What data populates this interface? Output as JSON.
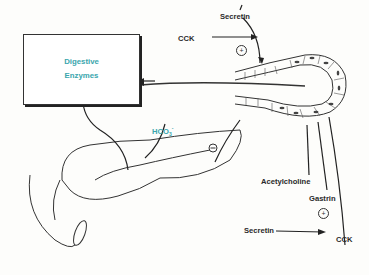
{
  "diagram": {
    "box": {
      "line1": "Digestive",
      "line2": "Enzymes",
      "color": "#3aa6ad"
    },
    "bicarbonate": {
      "base": "HCO",
      "sub": "3",
      "sup": "-",
      "color": "#3aa6ad"
    },
    "acinus_stimuli": {
      "secretin": "Secretin",
      "cck": "CCK",
      "plus": "+"
    },
    "duct_stimuli": {
      "acetylcholine": "Acetylcholine",
      "gastrin": "Gastrin",
      "secretin": "Secretin",
      "cck": "CCK",
      "plus": "+"
    },
    "inhibition_symbol": "−",
    "line_color": "#222222"
  }
}
